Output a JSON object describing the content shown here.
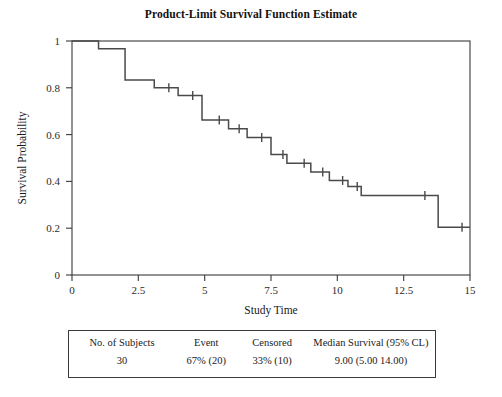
{
  "chart_data": {
    "type": "line",
    "title": "Product-Limit Survival Function Estimate",
    "xlabel": "Study Time",
    "ylabel": "Survival Probability",
    "xlim": [
      0,
      15
    ],
    "ylim": [
      0,
      1
    ],
    "xticks": [
      0,
      2.5,
      5,
      7.5,
      10,
      12.5,
      15
    ],
    "xtick_labels": [
      "0",
      "2.5",
      "5",
      "7.5",
      "10",
      "12.5",
      "15"
    ],
    "yticks": [
      0,
      0.2,
      0.4,
      0.6,
      0.8,
      1
    ],
    "ytick_labels": [
      "0",
      "0.2",
      "0.4",
      "0.6",
      "0.8",
      "1"
    ],
    "grid": false,
    "legend": "none",
    "series": [
      {
        "name": "Survival estimate",
        "style": "step-post",
        "x": [
          0.0,
          1.0,
          1.0,
          2.0,
          2.0,
          3.1,
          3.1,
          4.0,
          4.0,
          4.9,
          4.9,
          5.9,
          5.9,
          6.6,
          6.6,
          7.5,
          7.5,
          8.1,
          8.1,
          9.0,
          9.0,
          9.7,
          9.7,
          10.4,
          10.4,
          10.9,
          10.9,
          13.8,
          13.8,
          15.0
        ],
        "y": [
          1.0,
          1.0,
          0.967,
          0.967,
          0.833,
          0.833,
          0.8,
          0.8,
          0.767,
          0.767,
          0.662,
          0.662,
          0.625,
          0.625,
          0.588,
          0.588,
          0.515,
          0.515,
          0.478,
          0.478,
          0.44,
          0.44,
          0.404,
          0.404,
          0.378,
          0.378,
          0.34,
          0.34,
          0.204,
          0.204
        ]
      }
    ],
    "censored_points": {
      "name": "Censored observations",
      "marker": "vertical-tick",
      "x": [
        3.65,
        4.55,
        5.55,
        6.3,
        7.15,
        7.95,
        8.75,
        9.45,
        10.2,
        10.75,
        13.3,
        14.7
      ],
      "y": [
        0.8,
        0.767,
        0.662,
        0.625,
        0.588,
        0.515,
        0.478,
        0.44,
        0.404,
        0.378,
        0.34,
        0.204
      ]
    }
  },
  "summary": {
    "headers": {
      "subjects": "No. of Subjects",
      "event": "Event",
      "censored": "Censored",
      "median": "Median Survival (95% CL)"
    },
    "values": {
      "subjects": "30",
      "event": "67% (20)",
      "censored": "33% (10)",
      "median": "9.00 (5.00  14.00)"
    }
  }
}
